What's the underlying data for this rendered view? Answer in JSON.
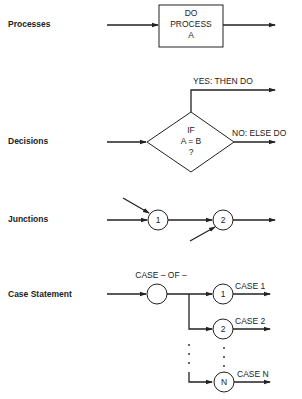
{
  "rows": {
    "processes": {
      "label": "Processes",
      "box_line1": "DO",
      "box_line2": "PROCESS",
      "box_line3": "A"
    },
    "decisions": {
      "label": "Decisions",
      "diamond_line1": "IF",
      "diamond_line2": "A = B",
      "diamond_line3": "?",
      "yes_label": "YES:  THEN DO",
      "no_label": "NO:  ELSE DO"
    },
    "junctions": {
      "label": "Junctions",
      "node1": "1",
      "node2": "2"
    },
    "case_statement": {
      "label": "Case Statement",
      "header": "CASE – OF –",
      "branches": [
        {
          "node": "1",
          "label": "CASE 1"
        },
        {
          "node": "2",
          "label": "CASE 2"
        },
        {
          "node": "N",
          "label": "CASE N"
        }
      ]
    }
  },
  "colors": {
    "line": "#222222",
    "background": "#ffffff"
  }
}
